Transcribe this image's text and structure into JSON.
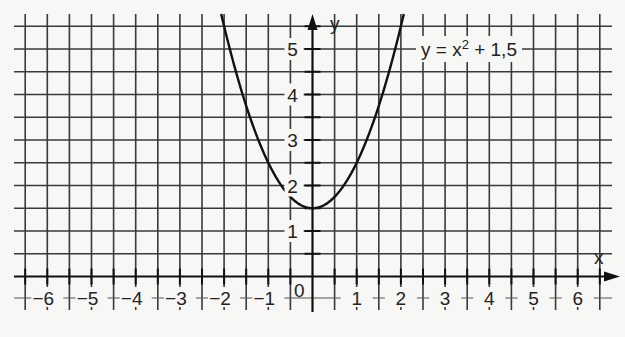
{
  "chart_data": {
    "type": "line",
    "title": "",
    "function_label": "y = x² + 1,5",
    "function_label_parts": {
      "base": "y = x",
      "exp": "2",
      "rest": " + 1,5"
    },
    "xlabel": "x",
    "ylabel": "y",
    "origin_label": "0",
    "xlim": [
      -6.5,
      6.5
    ],
    "ylim": [
      -0.5,
      5.5
    ],
    "grid": true,
    "grid_step": 0.5,
    "x_ticks": [
      -6,
      -5,
      -4,
      -3,
      -2,
      -1,
      1,
      2,
      3,
      4,
      5,
      6
    ],
    "x_tick_labels": [
      "−6",
      "−5",
      "−4",
      "−3",
      "−2",
      "−1",
      "1",
      "2",
      "3",
      "4",
      "5",
      "6"
    ],
    "y_ticks": [
      1,
      2,
      3,
      4,
      5
    ],
    "y_tick_labels": [
      "1",
      "2",
      "3",
      "4",
      "5"
    ],
    "series": [
      {
        "name": "y = x² + 1,5",
        "x": [
          -2.0,
          -1.5,
          -1.0,
          -0.5,
          0,
          0.5,
          1.0,
          1.5,
          2.0
        ],
        "y": [
          5.5,
          3.75,
          2.5,
          1.75,
          1.5,
          1.75,
          2.5,
          3.75,
          5.5
        ]
      }
    ],
    "vertex": [
      0,
      1.5
    ],
    "colors": {
      "grid": "#3a3a3a",
      "curve": "#111111",
      "background": "#f7f7f5"
    }
  }
}
